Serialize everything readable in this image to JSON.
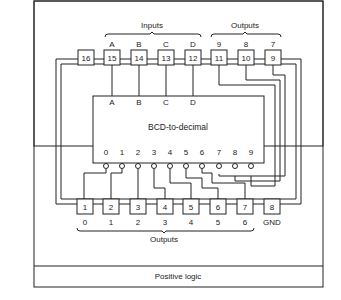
{
  "diagram": {
    "top_group_labels": {
      "inputs": "Inputs",
      "outputs": "Outputs"
    },
    "bottom_group_label": "Outputs",
    "chip_label": "BCD-to-decimal",
    "footer": "Positive logic",
    "top_pins": [
      {
        "pin": "16",
        "signal": ""
      },
      {
        "pin": "15",
        "signal": "A"
      },
      {
        "pin": "14",
        "signal": "B"
      },
      {
        "pin": "13",
        "signal": "C"
      },
      {
        "pin": "12",
        "signal": "D"
      },
      {
        "pin": "11",
        "signal": "9"
      },
      {
        "pin": "10",
        "signal": "8"
      },
      {
        "pin": "9",
        "signal": "7"
      }
    ],
    "bottom_pins": [
      {
        "pin": "1",
        "signal": "0"
      },
      {
        "pin": "2",
        "signal": "1"
      },
      {
        "pin": "3",
        "signal": "2"
      },
      {
        "pin": "4",
        "signal": "3"
      },
      {
        "pin": "5",
        "signal": "4"
      },
      {
        "pin": "6",
        "signal": "5"
      },
      {
        "pin": "7",
        "signal": "6"
      },
      {
        "pin": "8",
        "signal": "GND"
      }
    ],
    "chip_inputs": [
      "A",
      "B",
      "C",
      "D"
    ],
    "chip_outputs": [
      "0",
      "1",
      "2",
      "3",
      "4",
      "5",
      "6",
      "7",
      "8",
      "9"
    ]
  }
}
